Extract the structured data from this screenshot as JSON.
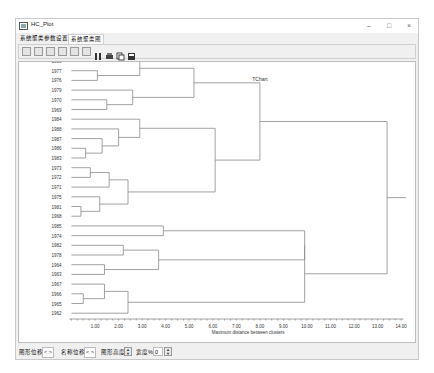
{
  "window": {
    "title": "HC_Plot",
    "minimize": "–",
    "maximize": "□",
    "close": "×"
  },
  "tabs": [
    {
      "label": "系统聚类参数设置",
      "active": false
    },
    {
      "label": "系统聚类图",
      "active": true
    }
  ],
  "toolbar": {
    "buttons": [
      "zoom-in-icon",
      "rotate-icon",
      "zoom-out-icon",
      "move-icon",
      "3d-chart-icon",
      "options-icon",
      "data-icon",
      "print-icon",
      "copy-icon",
      "save-icon"
    ]
  },
  "statusbar": {
    "graph_shift_label": "图形位移",
    "graph_shift_arrows": "< >",
    "label_shift_label": "名称位移",
    "label_shift_arrows": "< >",
    "graph_height_label": "图形高度",
    "width_label": "宽度%",
    "width_value": "0"
  },
  "chart_data": {
    "type": "dendrogram",
    "title": "TChart",
    "xlabel": "Maximum distance between clusters",
    "ylabel": "",
    "xlim": [
      0,
      14
    ],
    "xticks": [
      "1.00",
      "2.00",
      "3.00",
      "4.00",
      "5.00",
      "6.00",
      "7.00",
      "8.00",
      "9.00",
      "10.00",
      "11.00",
      "12.00",
      "13.00",
      "14.00"
    ],
    "leaves": [
      "1980",
      "1977",
      "1976",
      "1979",
      "1970",
      "1969",
      "1984",
      "1988",
      "1987",
      "1986",
      "1983",
      "1973",
      "1972",
      "1971",
      "1975",
      "1981",
      "1968",
      "1985",
      "1974",
      "1982",
      "1978",
      "1964",
      "1963",
      "1967",
      "1966",
      "1965",
      "1962"
    ],
    "merges": [
      {
        "members": [
          "1977",
          "1976"
        ],
        "height": 1.1
      },
      {
        "members": [
          "1980",
          "(1977,1976)"
        ],
        "height": 2.9
      },
      {
        "members": [
          "1970",
          "1969"
        ],
        "height": 1.5
      },
      {
        "members": [
          "1979",
          "(1970,1969)"
        ],
        "height": 2.6
      },
      {
        "members": [
          "A1",
          "A2"
        ],
        "height": 5.2
      },
      {
        "members": [
          "1986",
          "1983"
        ],
        "height": 0.6
      },
      {
        "members": [
          "1987",
          "(1986,1983)"
        ],
        "height": 1.3
      },
      {
        "members": [
          "1988",
          "B1"
        ],
        "height": 2.0
      },
      {
        "members": [
          "1984",
          "B2"
        ],
        "height": 2.9
      },
      {
        "members": [
          "1973",
          "1972"
        ],
        "height": 0.8
      },
      {
        "members": [
          "1971",
          "(1973,1972)"
        ],
        "height": 1.6
      },
      {
        "members": [
          "1981",
          "1968"
        ],
        "height": 0.4
      },
      {
        "members": [
          "1975",
          "(1981,1968)"
        ],
        "height": 1.2
      },
      {
        "members": [
          "C1",
          "C2"
        ],
        "height": 2.4
      },
      {
        "members": [
          "B",
          "C"
        ],
        "height": 6.1
      },
      {
        "members": [
          "A",
          "BC"
        ],
        "height": 8.0
      },
      {
        "members": [
          "1985",
          "1974"
        ],
        "height": 3.9
      },
      {
        "members": [
          "1982",
          "1978"
        ],
        "height": 2.2
      },
      {
        "members": [
          "1964",
          "1963"
        ],
        "height": 1.4
      },
      {
        "members": [
          "D1",
          "D2"
        ],
        "height": 3.7
      },
      {
        "members": [
          "E",
          "D"
        ],
        "height": 9.9
      },
      {
        "members": [
          "1965",
          "1966"
        ],
        "height": 0.5
      },
      {
        "members": [
          "1967",
          "(1966,1965)"
        ],
        "height": 1.4
      },
      {
        "members": [
          "F1",
          "1962"
        ],
        "height": 2.4
      },
      {
        "members": [
          "ED",
          "F"
        ],
        "height": 9.9
      },
      {
        "members": [
          "ABC",
          "DEF"
        ],
        "height": 13.4
      }
    ],
    "grid": false,
    "legend": "none"
  }
}
